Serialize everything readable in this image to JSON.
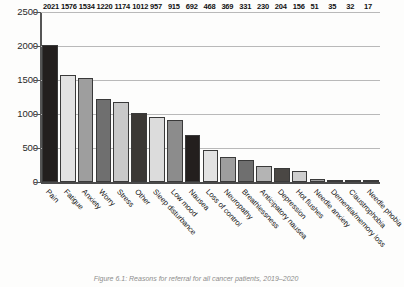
{
  "chart_data": {
    "type": "bar",
    "title": "",
    "xlabel": "",
    "ylabel": "",
    "ylim": [
      0,
      2500
    ],
    "yticks": [
      0,
      500,
      1000,
      1500,
      2000,
      2500
    ],
    "grid": true,
    "legend": null,
    "categories": [
      "Pain",
      "Fatigue",
      "Anxiety",
      "Worry",
      "Stress",
      "Other",
      "Sleep disturbance",
      "Low mood",
      "Nausea",
      "Loss of control",
      "Neuropathy",
      "Breathlessness",
      "Anticipatory nausea",
      "Depression",
      "Hot flushes",
      "Needle anxiety",
      "Dementia/memory loss",
      "Claustrophobia",
      "Needle phobia"
    ],
    "values": [
      2021,
      1576,
      1534,
      1220,
      1174,
      1012,
      957,
      915,
      692,
      468,
      369,
      331,
      230,
      204,
      156,
      51,
      35,
      32,
      17
    ],
    "bar_colors": [
      "#231f1e",
      "#e2e2e2",
      "#9e9e9e",
      "#6f6f6f",
      "#c9c9c9",
      "#3b3835",
      "#dcdcdc",
      "#8c8c8c",
      "#231f1e",
      "#e2e2e2",
      "#9e9e9e",
      "#6f6f6f",
      "#b4b4b4",
      "#4a4744",
      "#cfcfcf",
      "#9e9e9e",
      "#3b3835",
      "#8c8c8c",
      "#cfcfcf"
    ]
  },
  "caption": {
    "text": "Figure 6.1: Reasons for referral for all cancer patients, 2019–2020"
  },
  "colors": {
    "gridline": "#b9b9b9",
    "axis": "#4a4a4a",
    "background": "#fdfdfc",
    "value_label": "#111111"
  }
}
